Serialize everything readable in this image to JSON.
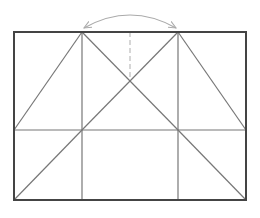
{
  "diagram": {
    "type": "geometric-fold-diagram",
    "colors": {
      "frame": "#444444",
      "inner_line": "#777777",
      "dashed_line": "#bbbbbb",
      "arc": "#aaaaaa",
      "background": "#ffffff"
    },
    "frame": {
      "x1": 14,
      "y1": 32,
      "x2": 246,
      "y2": 200
    },
    "verticals": [
      {
        "x": 82,
        "y1": 32,
        "y2": 200
      },
      {
        "x": 178,
        "y1": 32,
        "y2": 200
      }
    ],
    "horizontal": {
      "y": 130,
      "x1": 14,
      "x2": 246
    },
    "dashed": {
      "x": 130,
      "y1": 32,
      "y2": 80
    },
    "diagonals": [
      {
        "x1": 82,
        "y1": 32,
        "x2": 14,
        "y2": 130
      },
      {
        "x1": 82,
        "y1": 32,
        "x2": 178,
        "y2": 130
      },
      {
        "x1": 178,
        "y1": 32,
        "x2": 82,
        "y2": 130
      },
      {
        "x1": 178,
        "y1": 32,
        "x2": 246,
        "y2": 130
      },
      {
        "x1": 82,
        "y1": 130,
        "x2": 14,
        "y2": 200
      },
      {
        "x1": 178,
        "y1": 130,
        "x2": 246,
        "y2": 200
      }
    ],
    "arc": {
      "x1": 84,
      "y1": 28,
      "cx": 130,
      "cy": 2,
      "x2": 176,
      "y2": 28,
      "arrowheads": "both"
    }
  }
}
